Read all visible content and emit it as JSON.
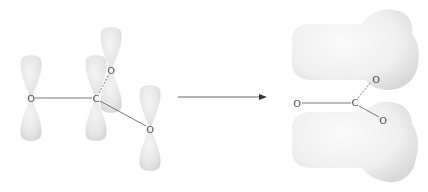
{
  "diagram": {
    "type": "molecular-orbital",
    "left_panel": {
      "label": "unhybridized p orbitals",
      "atoms": {
        "o_left": "O",
        "c_center": "C",
        "o_top": "O",
        "o_bottom_right": "O"
      }
    },
    "arrow": {
      "direction": "right"
    },
    "right_panel": {
      "label": "delocalized pi orbital",
      "atoms": {
        "o_left": "O",
        "c_center": "C",
        "o_top": "O",
        "o_bottom_right": "O"
      }
    },
    "colors": {
      "orbital_fill": "#e8e8e8",
      "orbital_shade": "#d4d4d4",
      "bond_line": "#555555",
      "text": "#333333"
    }
  }
}
